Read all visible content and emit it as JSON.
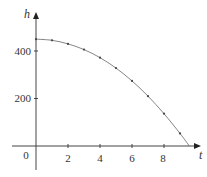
{
  "chart_data": {
    "type": "line",
    "title": "",
    "xlabel": "t",
    "ylabel": "h",
    "x": [
      0,
      1,
      2,
      3,
      4,
      5,
      6,
      7,
      8,
      9
    ],
    "series": [
      {
        "name": "h(t)",
        "values": [
          450,
          445,
          430,
          406,
          372,
          328,
          274,
          210,
          136,
          53
        ],
        "markers": true
      }
    ],
    "curve_end": {
      "t": 9.58,
      "h": 0
    },
    "x_ticks": [
      0,
      2,
      4,
      6,
      8
    ],
    "y_ticks": [
      200,
      400
    ],
    "xlim": [
      -0.9,
      10.2
    ],
    "ylim": [
      -180,
      600
    ],
    "grid": false,
    "legend": null
  },
  "labels": {
    "origin": "0",
    "x2": "2",
    "x4": "4",
    "x6": "6",
    "x8": "8",
    "y200": "200",
    "y400": "400",
    "xaxis": "t",
    "yaxis": "h"
  },
  "colors": {
    "axis": "#444444",
    "curve": "#666666",
    "marker": "#444444"
  }
}
